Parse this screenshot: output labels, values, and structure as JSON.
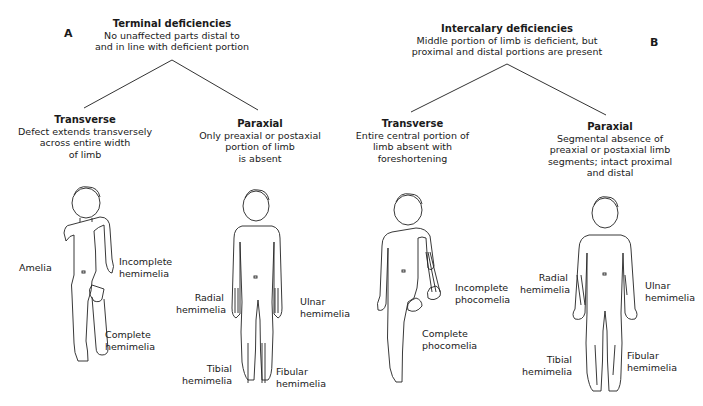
{
  "panel_a": {
    "letter": "A",
    "root": {
      "title": "Terminal deficiencies",
      "desc": [
        "No unaffected parts distal to",
        "and in line with deficient portion"
      ]
    },
    "branches": [
      {
        "title": "Transverse",
        "desc": [
          "Defect extends transversely",
          "across entire width",
          "of limb"
        ],
        "figure_labels": [
          "Amelia",
          "Incomplete",
          "hemimelia",
          "Complete",
          "hemimelia"
        ]
      },
      {
        "title": "Paraxial",
        "desc": [
          "Only preaxial or postaxial",
          "portion of limb",
          "is absent"
        ],
        "figure_labels": [
          "Radial",
          "hemimelia",
          "Ulnar",
          "hemimelia",
          "Tibial",
          "hemimelia",
          "Fibular",
          "hemimelia"
        ]
      }
    ]
  },
  "panel_b": {
    "letter": "B",
    "root": {
      "title": "Intercalary deficiencies",
      "desc": [
        "Middle portion of limb is deficient, but",
        "proximal and distal portions are present"
      ]
    },
    "branches": [
      {
        "title": "Transverse",
        "desc": [
          "Entire central portion of",
          "limb absent with",
          "foreshortening"
        ],
        "figure_labels": [
          "Incomplete",
          "phocomelia",
          "Complete",
          "phocomelia"
        ]
      },
      {
        "title": "Paraxial",
        "desc": [
          "Segmental absence of",
          "preaxial or postaxial limb",
          "segments; intact proximal",
          "and distal"
        ],
        "figure_labels": [
          "Radial",
          "hemimelia",
          "Ulnar",
          "hemimelia",
          "Tibial",
          "hemimelia",
          "Fibular",
          "hemimelia"
        ]
      }
    ]
  },
  "icons": {
    "figures": [
      "child-figure-amelia-hemimelia",
      "child-figure-paraxial-terminal",
      "child-figure-phocomelia",
      "child-figure-paraxial-intercalary"
    ]
  }
}
